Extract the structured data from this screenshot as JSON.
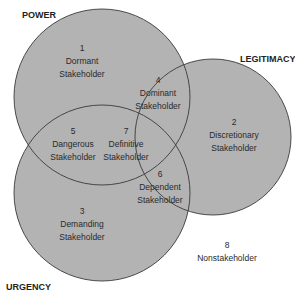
{
  "diagram": {
    "type": "venn",
    "sets": [
      {
        "id": "power",
        "label": "POWER"
      },
      {
        "id": "legitimacy",
        "label": "LEGITIMACY"
      },
      {
        "id": "urgency",
        "label": "URGENCY"
      }
    ],
    "regions": [
      {
        "number": "1",
        "line1": "Dormant",
        "line2": "Stakeholder",
        "sets": [
          "power"
        ]
      },
      {
        "number": "2",
        "line1": "Discretionary",
        "line2": "Stakeholder",
        "sets": [
          "legitimacy"
        ]
      },
      {
        "number": "3",
        "line1": "Demanding",
        "line2": "Stakeholder",
        "sets": [
          "urgency"
        ]
      },
      {
        "number": "4",
        "line1": "Dominant",
        "line2": "Stakeholder",
        "sets": [
          "power",
          "legitimacy"
        ]
      },
      {
        "number": "5",
        "line1": "Dangerous",
        "line2": "Stakeholder",
        "sets": [
          "power",
          "urgency"
        ]
      },
      {
        "number": "6",
        "line1": "Dependent",
        "line2": "Stakeholder",
        "sets": [
          "legitimacy",
          "urgency"
        ]
      },
      {
        "number": "7",
        "line1": "Definitive",
        "line2": "Stakeholder",
        "sets": [
          "power",
          "legitimacy",
          "urgency"
        ]
      },
      {
        "number": "8",
        "line1": "Nonstakeholder",
        "line2": "",
        "sets": []
      }
    ],
    "colors": {
      "fill": "#b3b3b3",
      "stroke": "#3a3a3a",
      "background": "#ffffff"
    }
  }
}
